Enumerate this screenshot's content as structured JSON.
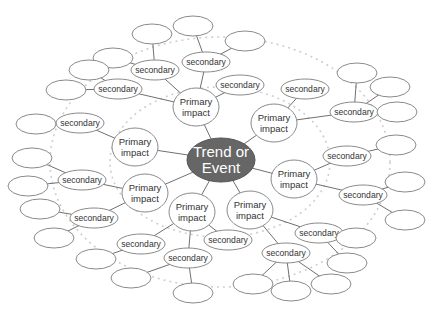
{
  "colors": {
    "center_fill": "#666666",
    "center_text": "#ffffff",
    "node_stroke": "#8a8a8a",
    "edge": "#707070",
    "ring": "#cfcfcf"
  },
  "labels": {
    "center": [
      "Trend or",
      "Event"
    ],
    "primary": [
      "Primary",
      "impact"
    ],
    "secondary": "secondary",
    "tertiary": ""
  },
  "rings": [
    {
      "cx": 220,
      "cy": 162,
      "rx": 110,
      "ry": 75
    },
    {
      "cx": 220,
      "cy": 162,
      "rx": 170,
      "ry": 125
    }
  ],
  "nodes": [
    {
      "id": "c",
      "type": "center",
      "x": 221,
      "y": 160,
      "rx": 34,
      "ry": 22
    },
    {
      "id": "p1",
      "type": "primary",
      "x": 196,
      "y": 107
    },
    {
      "id": "p2",
      "type": "primary",
      "x": 274,
      "y": 123
    },
    {
      "id": "p3",
      "type": "primary",
      "x": 135,
      "y": 147
    },
    {
      "id": "p4",
      "type": "primary",
      "x": 294,
      "y": 179
    },
    {
      "id": "p5",
      "type": "primary",
      "x": 145,
      "y": 193
    },
    {
      "id": "p6",
      "type": "primary",
      "x": 192,
      "y": 212
    },
    {
      "id": "p7",
      "type": "primary",
      "x": 250,
      "y": 210
    },
    {
      "id": "s1",
      "type": "secondary",
      "x": 155,
      "y": 70,
      "p": "p1"
    },
    {
      "id": "s2",
      "type": "secondary",
      "x": 206,
      "y": 62,
      "p": "p1"
    },
    {
      "id": "s3",
      "type": "secondary",
      "x": 240,
      "y": 85,
      "p": "p1"
    },
    {
      "id": "s4",
      "type": "secondary",
      "x": 118,
      "y": 89,
      "p": "p1"
    },
    {
      "id": "s5",
      "type": "secondary",
      "x": 305,
      "y": 89,
      "p": "p2"
    },
    {
      "id": "s6",
      "type": "secondary",
      "x": 354,
      "y": 112,
      "p": "p2"
    },
    {
      "id": "s7",
      "type": "secondary",
      "x": 80,
      "y": 123,
      "p": "p3"
    },
    {
      "id": "s8",
      "type": "secondary",
      "x": 347,
      "y": 156,
      "p": "p4"
    },
    {
      "id": "s9",
      "type": "secondary",
      "x": 363,
      "y": 195,
      "p": "p4"
    },
    {
      "id": "s10",
      "type": "secondary",
      "x": 82,
      "y": 180,
      "p": "p5"
    },
    {
      "id": "s11",
      "type": "secondary",
      "x": 94,
      "y": 218,
      "p": "p5"
    },
    {
      "id": "s12",
      "type": "secondary",
      "x": 228,
      "y": 240,
      "p": "p6"
    },
    {
      "id": "s13",
      "type": "secondary",
      "x": 141,
      "y": 244,
      "p": "p6"
    },
    {
      "id": "s14",
      "type": "secondary",
      "x": 188,
      "y": 258,
      "p": "p6"
    },
    {
      "id": "s15",
      "type": "secondary",
      "x": 319,
      "y": 233,
      "p": "p7"
    },
    {
      "id": "s16",
      "type": "secondary",
      "x": 286,
      "y": 253,
      "p": "p7"
    },
    {
      "id": "t1",
      "type": "tertiary",
      "x": 152,
      "y": 34,
      "p": "s1"
    },
    {
      "id": "t2",
      "type": "tertiary",
      "x": 113,
      "y": 58,
      "p": "s1"
    },
    {
      "id": "t3",
      "type": "tertiary",
      "x": 193,
      "y": 26,
      "p": "s2"
    },
    {
      "id": "t4",
      "type": "tertiary",
      "x": 245,
      "y": 41,
      "p": "s2"
    },
    {
      "id": "t5",
      "type": "tertiary",
      "x": 89,
      "y": 70,
      "p": "s4"
    },
    {
      "id": "t6",
      "type": "tertiary",
      "x": 66,
      "y": 90,
      "p": "s4"
    },
    {
      "id": "t7",
      "type": "tertiary",
      "x": 357,
      "y": 73,
      "p": "s6"
    },
    {
      "id": "t8",
      "type": "tertiary",
      "x": 390,
      "y": 87,
      "p": "s6"
    },
    {
      "id": "t9",
      "type": "tertiary",
      "x": 397,
      "y": 112,
      "p": "s6"
    },
    {
      "id": "t10",
      "type": "tertiary",
      "x": 36,
      "y": 124,
      "p": "s7"
    },
    {
      "id": "t11",
      "type": "tertiary",
      "x": 396,
      "y": 145,
      "p": "s8"
    },
    {
      "id": "t12",
      "type": "tertiary",
      "x": 405,
      "y": 182,
      "p": "s9"
    },
    {
      "id": "t13",
      "type": "tertiary",
      "x": 405,
      "y": 220,
      "p": "s9"
    },
    {
      "id": "t14",
      "type": "tertiary",
      "x": 32,
      "y": 158,
      "p": "s10"
    },
    {
      "id": "t15",
      "type": "tertiary",
      "x": 28,
      "y": 186,
      "p": "s10"
    },
    {
      "id": "t16",
      "type": "tertiary",
      "x": 40,
      "y": 209,
      "p": "s11"
    },
    {
      "id": "t17",
      "type": "tertiary",
      "x": 54,
      "y": 238,
      "p": "s11"
    },
    {
      "id": "t18",
      "type": "tertiary",
      "x": 96,
      "y": 259,
      "p": "s13"
    },
    {
      "id": "t19",
      "type": "tertiary",
      "x": 131,
      "y": 278,
      "p": "s14"
    },
    {
      "id": "t20",
      "type": "tertiary",
      "x": 193,
      "y": 293,
      "p": "s14"
    },
    {
      "id": "t21",
      "type": "tertiary",
      "x": 356,
      "y": 238,
      "p": "s15"
    },
    {
      "id": "t22",
      "type": "tertiary",
      "x": 347,
      "y": 263,
      "p": "s15"
    },
    {
      "id": "t23",
      "type": "tertiary",
      "x": 253,
      "y": 284,
      "p": "s16"
    },
    {
      "id": "t24",
      "type": "tertiary",
      "x": 291,
      "y": 291,
      "p": "s16"
    },
    {
      "id": "t25",
      "type": "tertiary",
      "x": 331,
      "y": 284,
      "p": "s16"
    }
  ]
}
